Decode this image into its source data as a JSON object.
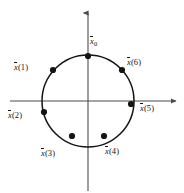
{
  "figure": {
    "background_color": "#ffffff",
    "stroke_color": "#141414",
    "axis_color": "#4d4d4d",
    "axes": {
      "x_axis_name": "horizontal-axis",
      "y_axis_name": "vertical-axis",
      "center": [
        88,
        101
      ]
    },
    "circle": {
      "center_x": 88,
      "center_y": 101,
      "radius": 46
    },
    "points": [
      {
        "id": "x0",
        "var": "x",
        "sub": "0",
        "index": "",
        "label_text": "x̅0",
        "cx": 88,
        "cy": 56,
        "label_x": 90,
        "label_y": 36
      },
      {
        "id": "x1",
        "var": "x",
        "sub": "",
        "index": "(1)",
        "label_text": "x̅(1)",
        "cx": 53,
        "cy": 70,
        "label_x": 14,
        "label_y": 62
      },
      {
        "id": "x2",
        "var": "x",
        "sub": "",
        "index": "(2)",
        "label_text": "x̅(2)",
        "cx": 44,
        "cy": 112,
        "label_x": 8,
        "label_y": 110
      },
      {
        "id": "x3",
        "var": "x",
        "sub": "",
        "index": "(3)",
        "label_text": "x̅(3)",
        "cx": 72,
        "cy": 136,
        "label_x": 41,
        "label_y": 148
      },
      {
        "id": "x4",
        "var": "x",
        "sub": "",
        "index": "(4)",
        "label_text": "x̅(4)",
        "cx": 104,
        "cy": 136,
        "label_x": 105,
        "label_y": 146
      },
      {
        "id": "x5",
        "var": "x",
        "sub": "",
        "index": "(5)",
        "label_text": "x̅(5)",
        "cx": 131,
        "cy": 104,
        "label_x": 140,
        "label_y": 103
      },
      {
        "id": "x6",
        "var": "x",
        "sub": "",
        "index": "(6)",
        "label_text": "x̅(6)",
        "cx": 122,
        "cy": 70,
        "label_x": 127,
        "label_y": 57
      }
    ]
  }
}
